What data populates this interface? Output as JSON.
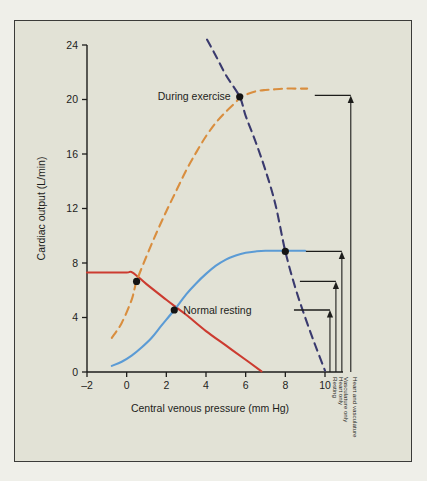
{
  "figure": {
    "background_color": "#e2e2d6",
    "border_color": "#3b3b39",
    "page_background": "#efefe9"
  },
  "chart_data": {
    "type": "line",
    "title": "",
    "subtitle": "",
    "xlabel": "Central venous pressure (mm Hg)",
    "ylabel": "Cardiac output (L/min)",
    "xlim": [
      -2,
      10
    ],
    "ylim": [
      0,
      24
    ],
    "xticks": [
      -2,
      0,
      2,
      4,
      6,
      8,
      10
    ],
    "xticklabels": [
      "–2",
      "0",
      "2",
      "4",
      "6",
      "8",
      "10"
    ],
    "yticks": [
      0,
      4,
      8,
      12,
      16,
      20,
      24
    ],
    "yticklabels": [
      "0",
      "4",
      "8",
      "12",
      "16",
      "20",
      "24"
    ],
    "grid": false,
    "legend_position": "none",
    "series": [
      {
        "name": "Normal vascular function curve",
        "role": "vascular-function-resting",
        "color": "#cc3b30",
        "style": "solid",
        "points": [
          [
            -2.0,
            7.3
          ],
          [
            -1.0,
            7.3
          ],
          [
            0.0,
            7.3
          ],
          [
            0.3,
            7.3
          ],
          [
            1.0,
            6.45
          ],
          [
            2.0,
            5.3
          ],
          [
            2.4,
            4.85
          ],
          [
            3.0,
            4.2
          ],
          [
            4.0,
            3.0
          ],
          [
            5.0,
            1.95
          ],
          [
            6.0,
            0.9
          ],
          [
            6.8,
            0.05
          ]
        ]
      },
      {
        "name": "Exercise vascular function curve",
        "role": "vascular-function-exercise",
        "color": "#d98e3f",
        "style": "dashed",
        "points": [
          [
            -0.75,
            2.5
          ],
          [
            -0.25,
            3.6
          ],
          [
            0.25,
            5.3
          ],
          [
            0.5,
            6.65
          ],
          [
            1.0,
            8.5
          ],
          [
            1.5,
            10.2
          ],
          [
            2.0,
            11.8
          ],
          [
            2.5,
            13.3
          ],
          [
            3.0,
            14.8
          ],
          [
            3.5,
            16.1
          ],
          [
            4.0,
            17.3
          ],
          [
            4.5,
            18.3
          ],
          [
            5.0,
            19.1
          ],
          [
            5.5,
            19.8
          ],
          [
            5.7,
            20.15
          ],
          [
            6.0,
            20.35
          ],
          [
            6.5,
            20.6
          ],
          [
            7.0,
            20.7
          ],
          [
            7.5,
            20.75
          ],
          [
            8.0,
            20.8
          ],
          [
            8.5,
            20.8
          ],
          [
            9.1,
            20.8
          ]
        ]
      },
      {
        "name": "Normal cardiac function curve",
        "role": "cardiac-function-normal",
        "color": "#5b9bd5",
        "style": "solid",
        "points": [
          [
            -0.75,
            0.45
          ],
          [
            -0.25,
            0.75
          ],
          [
            0.25,
            1.2
          ],
          [
            0.75,
            1.8
          ],
          [
            1.25,
            2.5
          ],
          [
            1.75,
            3.4
          ],
          [
            2.4,
            4.55
          ],
          [
            3.0,
            5.7
          ],
          [
            3.5,
            6.5
          ],
          [
            4.0,
            7.2
          ],
          [
            4.5,
            7.8
          ],
          [
            5.0,
            8.25
          ],
          [
            5.5,
            8.55
          ],
          [
            6.0,
            8.75
          ],
          [
            6.5,
            8.85
          ],
          [
            7.0,
            8.9
          ],
          [
            8.0,
            8.9
          ],
          [
            9.0,
            8.9
          ]
        ]
      },
      {
        "name": "Exercise cardiac function curve",
        "role": "cardiac-function-exercise",
        "color": "#3a3a6e",
        "style": "dashed",
        "points": [
          [
            4.05,
            24.4
          ],
          [
            4.5,
            23.2
          ],
          [
            5.0,
            21.8
          ],
          [
            5.7,
            20.2
          ],
          [
            6.0,
            18.8
          ],
          [
            6.5,
            16.9
          ],
          [
            7.0,
            14.8
          ],
          [
            7.5,
            12.3
          ],
          [
            8.0,
            8.85
          ],
          [
            8.5,
            6.2
          ],
          [
            9.0,
            4.0
          ],
          [
            9.5,
            2.0
          ],
          [
            10.0,
            0.1
          ]
        ]
      }
    ],
    "points": [
      {
        "name": "resting-equilibrium",
        "x": 0.5,
        "y": 6.65,
        "label": "",
        "label_position": "none"
      },
      {
        "name": "normal-resting",
        "x": 2.4,
        "y": 4.55,
        "label": "Normal resting",
        "label_position": "right"
      },
      {
        "name": "during-exercise",
        "x": 5.7,
        "y": 20.2,
        "label": "During exercise",
        "label_position": "left"
      },
      {
        "name": "heart-and-vasculature-equilibrium",
        "x": 8.0,
        "y": 8.85,
        "label": "",
        "label_position": "none"
      }
    ],
    "annotations": [
      {
        "name": "resting",
        "label": "Resting",
        "value": 4.55,
        "x": 10.25
      },
      {
        "name": "heart-only",
        "label": "Heart only",
        "value": 6.65,
        "x": 10.55
      },
      {
        "name": "vasculature-only",
        "label": "Vasculature only",
        "value": 8.85,
        "x": 10.85
      },
      {
        "name": "heart-and-vasculature",
        "label": "Heart and vasculature",
        "value": 20.3,
        "x": 11.3
      }
    ]
  }
}
